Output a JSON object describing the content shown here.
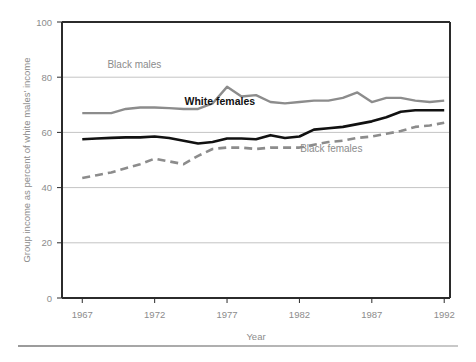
{
  "chart_data": {
    "type": "line",
    "title": "",
    "xlabel": "Year",
    "ylabel": "Group income as percent of white males' income",
    "xlim": [
      1965.6,
      1992.4
    ],
    "ylim": [
      0,
      100
    ],
    "grid": true,
    "legend_position": "inline-annotations",
    "x_ticks": [
      "1967",
      "1972",
      "1977",
      "1982",
      "1987",
      "1992"
    ],
    "x_tick_values": [
      1967,
      1972,
      1977,
      1982,
      1987,
      1992
    ],
    "y_ticks": [
      "0",
      "20",
      "40",
      "60",
      "80",
      "100"
    ],
    "y_tick_values": [
      0,
      20,
      40,
      60,
      80,
      100
    ],
    "x": [
      1967,
      1968,
      1969,
      1970,
      1971,
      1972,
      1973,
      1974,
      1975,
      1976,
      1977,
      1978,
      1979,
      1980,
      1981,
      1982,
      1983,
      1984,
      1985,
      1986,
      1987,
      1988,
      1989,
      1990,
      1991,
      1992
    ],
    "series": [
      {
        "name": "Black males",
        "color": "#8c8c8c",
        "style": "solid",
        "width": 2.4,
        "label": "Black males",
        "label_x": 1970.6,
        "label_y": 83.5,
        "values": [
          67.0,
          67.0,
          67.0,
          68.5,
          69.0,
          69.0,
          68.8,
          68.5,
          68.5,
          70.5,
          76.5,
          73.0,
          73.5,
          71.0,
          70.5,
          71.0,
          71.5,
          71.5,
          72.5,
          74.5,
          71.0,
          72.5,
          72.5,
          71.5,
          71.0,
          71.5
        ]
      },
      {
        "name": "White females",
        "color": "#111111",
        "style": "solid",
        "width": 2.6,
        "label": "White females",
        "label_x": 1976.5,
        "label_y": 70.0,
        "values": [
          57.5,
          57.8,
          58.0,
          58.2,
          58.2,
          58.5,
          58.0,
          57.0,
          56.0,
          56.5,
          57.8,
          57.8,
          57.5,
          59.0,
          58.0,
          58.5,
          61.0,
          61.5,
          62.0,
          63.0,
          64.0,
          65.5,
          67.5,
          68.0,
          68.0,
          68.0
        ]
      },
      {
        "name": "Black females",
        "color": "#8c8c8c",
        "style": "dashed",
        "width": 2.6,
        "label": "Black females",
        "label_x": 1984.2,
        "label_y": 53.0,
        "values": [
          43.5,
          44.5,
          45.5,
          47.0,
          48.5,
          50.5,
          49.5,
          48.5,
          51.5,
          54.0,
          54.5,
          54.5,
          54.0,
          54.5,
          54.5,
          54.5,
          55.5,
          56.5,
          57.0,
          58.0,
          58.5,
          59.5,
          60.5,
          62.0,
          62.5,
          63.5
        ]
      }
    ]
  },
  "colors": {
    "axis": "#2b2b2b",
    "grid": "#c4c4c4",
    "tick_text": "#8c8c8c",
    "gray_series": "#8c8c8c",
    "black_series": "#111111",
    "footer_rule": "#9a9a9a"
  }
}
